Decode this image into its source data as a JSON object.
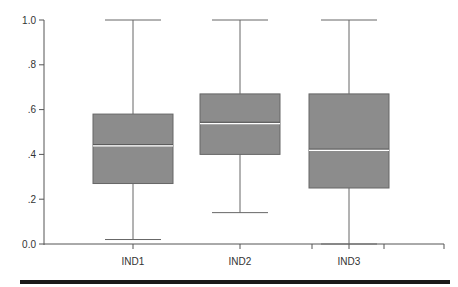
{
  "chart_data": {
    "type": "box",
    "title": "",
    "xlabel": "",
    "ylabel": "",
    "ylim": [
      0,
      1
    ],
    "yticks": [
      0.0,
      0.2,
      0.4,
      0.6,
      0.8,
      1.0
    ],
    "ytick_labels": [
      "0.0",
      ".2",
      ".4",
      ".6",
      ".8",
      "1.0"
    ],
    "categories": [
      "IND1",
      "IND2",
      "IND3"
    ],
    "series": [
      {
        "name": "IND1",
        "min": 0.02,
        "q1": 0.27,
        "median": 0.44,
        "q3": 0.58,
        "max": 1.0
      },
      {
        "name": "IND2",
        "min": 0.14,
        "q1": 0.4,
        "median": 0.54,
        "q3": 0.67,
        "max": 1.0
      },
      {
        "name": "IND3",
        "min": 0.0,
        "q1": 0.25,
        "median": 0.42,
        "q3": 0.67,
        "max": 1.0
      }
    ],
    "box_color": "#8c8c8c",
    "median_color": "#ffffff",
    "grid": false,
    "legend": "none"
  }
}
